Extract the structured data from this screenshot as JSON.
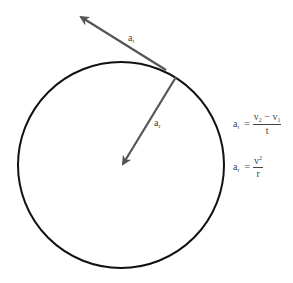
{
  "diagram": {
    "type": "circular-motion-acceleration",
    "colors": {
      "circle": "#111111",
      "arrow": "#555555",
      "text": "#444444",
      "background": "#ffffff"
    },
    "circle": {
      "cx": 121,
      "cy": 165,
      "r": 103
    },
    "tangential_arrow": {
      "from": [
        166,
        70
      ],
      "to": [
        79,
        16
      ],
      "label_main": "a",
      "label_sub": "t"
    },
    "radial_arrow": {
      "from": [
        176,
        77
      ],
      "to": [
        122,
        166
      ],
      "label_main": "a",
      "label_sub": "r"
    }
  },
  "formulas": {
    "tangential": {
      "lhs_main": "a",
      "lhs_sub": "t",
      "equals": "=",
      "num_v2": "v",
      "num_v2_sub": "2",
      "minus": " − ",
      "num_v1": "v",
      "num_v1_sub": "1",
      "den": "t"
    },
    "radial": {
      "lhs_main": "a",
      "lhs_sub": "r",
      "equals": "=",
      "num": "v",
      "num_sup": "2",
      "den": "r"
    }
  }
}
